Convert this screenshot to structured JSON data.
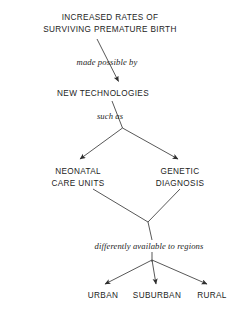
{
  "diagram": {
    "title_node": {
      "name": "increased-rates-node",
      "line1": "INCREASED RATES OF",
      "line2": "SURVIVING PREMATURE BIRTH"
    },
    "technologies_node": {
      "name": "new-technologies-node",
      "label": "NEW TECHNOLOGIES"
    },
    "neonatal_node": {
      "name": "neonatal-care-units-node",
      "line1": "NEONATAL",
      "line2": "CARE UNITS"
    },
    "genetic_node": {
      "name": "genetic-diagnosis-node",
      "line1": "GENETIC",
      "line2": "DIAGNOSIS"
    },
    "region_nodes": [
      {
        "label": "URBAN"
      },
      {
        "label": "SUBURBAN"
      },
      {
        "label": "RURAL"
      }
    ],
    "edge_labels": {
      "made_possible_by": "made possible by",
      "such_as": "such as",
      "differently_available": "differently available to regions"
    },
    "colors": {
      "background": "#ffffff",
      "text": "#232323",
      "edge_label_text": "#1d1d1d",
      "line": "#3a3a3a"
    }
  }
}
